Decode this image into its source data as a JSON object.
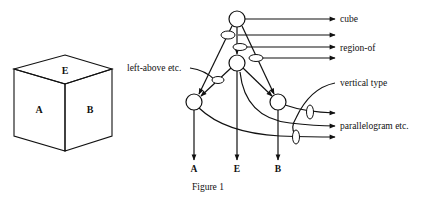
{
  "figure": {
    "caption": "Figure 1",
    "colors": {
      "ink": "#111111",
      "background": "#ffffff"
    }
  },
  "cube": {
    "faces": {
      "top": "E",
      "left": "A",
      "right": "B"
    }
  },
  "network": {
    "left_label": "left-above etc.",
    "right_labels": {
      "cube": "cube",
      "region_of": "region-of",
      "vertical_type": "vertical type",
      "parallelogram": "parallelogram etc."
    },
    "bottom_labels": {
      "a": "A",
      "e": "E",
      "b": "B"
    }
  }
}
